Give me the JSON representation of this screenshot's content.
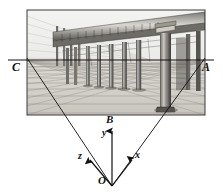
{
  "figure": {
    "type": "geometry-perspective-diagram",
    "width": 223,
    "height": 196,
    "background_color": "#ffffff",
    "ink_color": "#111111"
  },
  "picture_plane": {
    "name": "engraving-frame",
    "description": "Rectangular framed engraving of a classical colonnade seen in two-point perspective",
    "frame_color": "#3a3a3a",
    "rect": {
      "x": 27,
      "y": 10,
      "width": 178,
      "height": 105
    },
    "scene": {
      "subject": "classical colonnade",
      "elements": [
        "coffered entablature",
        "receding row of columns",
        "large foreground column at right",
        "gridded tile floor",
        "faint perspective construction lines at left"
      ],
      "tone_color": "#8d8d8d"
    }
  },
  "horizon_line": {
    "name": "horizon-line",
    "y": 60,
    "x_start": 8,
    "x_end": 214,
    "color": "#111111"
  },
  "vanishing_points": [
    {
      "id": "C",
      "label": "C",
      "x": 27,
      "y": 60,
      "label_x": 13,
      "label_y": 62
    },
    {
      "id": "A",
      "label": "A",
      "x": 205,
      "y": 60,
      "label_x": 203,
      "label_y": 62
    }
  ],
  "projection_rays": [
    {
      "name": "ray-left",
      "from_x": 112,
      "from_y": 186,
      "to_x": 27,
      "to_y": 58
    },
    {
      "name": "ray-right",
      "from_x": 112,
      "from_y": 186,
      "to_x": 205,
      "to_y": 58
    }
  ],
  "axes": {
    "origin": {
      "label": "O",
      "x": 112,
      "y": 186,
      "label_x": 99,
      "label_y": 176
    },
    "vertical": {
      "name": "y-axis",
      "label": "y",
      "from_x": 112,
      "from_y": 186,
      "to_x": 112,
      "to_y": 130,
      "label_x": 103,
      "label_y": 130
    },
    "apex": {
      "label": "B",
      "x": 112,
      "y": 120,
      "label_x": 106,
      "label_y": 116
    },
    "left_axis": {
      "name": "z-axis",
      "label": "z",
      "from_x": 112,
      "from_y": 186,
      "to_x": 89,
      "to_y": 159,
      "label_x": 79,
      "label_y": 153
    },
    "right_axis": {
      "name": "x-axis",
      "label": "x",
      "from_x": 112,
      "from_y": 186,
      "to_x": 133,
      "to_y": 159,
      "label_x": 135,
      "label_y": 152
    }
  }
}
